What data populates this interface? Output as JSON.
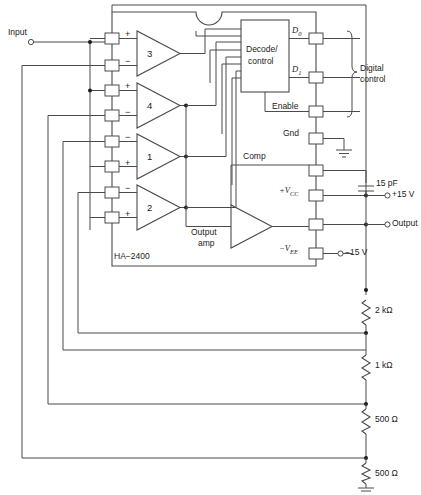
{
  "figure": {
    "device_label": "HA−2400",
    "caption": ""
  },
  "io": {
    "input_label": "Input",
    "output_label": "Output"
  },
  "amps": [
    {
      "id": "amp3",
      "number": "3",
      "top_sign": "+",
      "bottom_sign": "−"
    },
    {
      "id": "amp4",
      "number": "4",
      "top_sign": "+",
      "bottom_sign": "−"
    },
    {
      "id": "amp1",
      "number": "1",
      "top_sign": "−",
      "bottom_sign": "+"
    },
    {
      "id": "amp2",
      "number": "2",
      "top_sign": "−",
      "bottom_sign": "+"
    }
  ],
  "blocks": {
    "decode_line1": "Decode/",
    "decode_line2": "control",
    "output_amp_line1": "Output",
    "output_amp_line2": "amp"
  },
  "pins": {
    "d0": "D",
    "d0_sub": "0",
    "d1": "D",
    "d1_sub": "1",
    "enable": "Enable",
    "gnd": "Gnd",
    "comp": "Comp",
    "vcc": "+V",
    "vcc_sub": "CC",
    "vee": "−V",
    "vee_sub": "EE"
  },
  "annotations": {
    "digital_control_line1": "Digital",
    "digital_control_line2": "control"
  },
  "supplies": {
    "cap_value": "15 pF",
    "v_pos": "+15 V",
    "v_neg": "−15 V"
  },
  "resistors": [
    {
      "name": "r1",
      "value": "2 kΩ"
    },
    {
      "name": "r2",
      "value": "1 kΩ"
    },
    {
      "name": "r3",
      "value": "500 Ω"
    },
    {
      "name": "r4",
      "value": "500 Ω"
    }
  ],
  "colors": {
    "wire": "#4a4a4a",
    "text": "#1b1b1b",
    "background": "#ffffff"
  }
}
